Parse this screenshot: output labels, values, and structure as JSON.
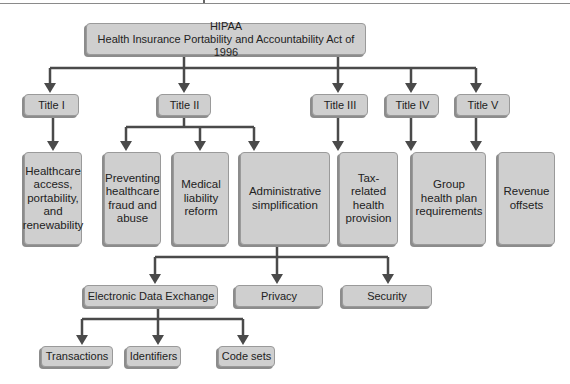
{
  "diagram": {
    "root": {
      "line1": "HIPAA",
      "line2": "Health Insurance Portability and Accountability Act of 1996"
    },
    "titles": [
      {
        "label": "Title I",
        "child": [
          "Healthcare",
          "access,",
          "portability,",
          "and",
          "renewability"
        ]
      },
      {
        "label": "Title II",
        "children": [
          [
            "Preventing",
            "healthcare",
            "fraud and",
            "abuse"
          ],
          [
            "Medical",
            "liability",
            "reform"
          ],
          [
            "Administrative",
            "simplification"
          ]
        ]
      },
      {
        "label": "Title III",
        "child": [
          "Tax-related",
          "health",
          "provision"
        ]
      },
      {
        "label": "Title IV",
        "child": [
          "Group",
          "health plan",
          "requirements"
        ]
      },
      {
        "label": "Title V",
        "child": [
          "Revenue",
          "offsets"
        ]
      }
    ],
    "admin_simplification_children": [
      "Electronic Data Exchange",
      "Privacy",
      "Security"
    ],
    "electronic_data_exchange_children": [
      "Transactions",
      "Identifiers",
      "Code sets"
    ],
    "colors": {
      "box_fill": "#cfcfcf",
      "box_border": "#9a9a9a",
      "connector": "#4a4a4a"
    }
  }
}
